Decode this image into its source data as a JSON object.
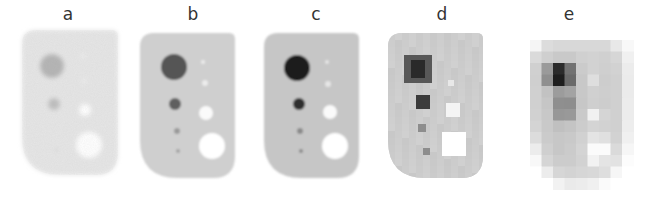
{
  "figure": {
    "width": 647,
    "height": 198,
    "background": "#ffffff",
    "panels": [
      {
        "label": "a",
        "label_x": 68,
        "style": "noisy",
        "body": {
          "x": 22,
          "y": 30,
          "w": 96,
          "h": 145,
          "fill": "#e6e6e6",
          "blur": 2.2
        },
        "hot": [
          {
            "cx": 52,
            "cy": 66,
            "r": 12,
            "fill": "#b3b3b3"
          },
          {
            "cx": 54,
            "cy": 104,
            "r": 6,
            "fill": "#bdbdbd"
          },
          {
            "cx": 56,
            "cy": 150,
            "r": 2,
            "fill": "#d8d8d8"
          }
        ],
        "cold": [
          {
            "cx": 83,
            "cy": 56,
            "r": 2,
            "fill": "#f3f3f3"
          },
          {
            "cx": 84,
            "cy": 81,
            "r": 2,
            "fill": "#f3f3f3"
          },
          {
            "cx": 85,
            "cy": 110,
            "r": 6,
            "fill": "#ffffff"
          },
          {
            "cx": 89,
            "cy": 145,
            "r": 13,
            "fill": "#ffffff"
          }
        ]
      },
      {
        "label": "b",
        "label_x": 193,
        "style": "smooth",
        "body": {
          "x": 140,
          "y": 33,
          "w": 95,
          "h": 145,
          "fill": "#cfcfcf",
          "blur": 1.2
        },
        "hot": [
          {
            "cx": 174,
            "cy": 67,
            "r": 13,
            "fill": "#555555"
          },
          {
            "cx": 175,
            "cy": 104,
            "r": 6,
            "fill": "#5e5e5e"
          },
          {
            "cx": 177,
            "cy": 131,
            "r": 3,
            "fill": "#9a9a9a"
          },
          {
            "cx": 178,
            "cy": 151,
            "r": 2,
            "fill": "#a2a2a2"
          }
        ],
        "cold": [
          {
            "cx": 203,
            "cy": 62,
            "r": 2,
            "fill": "#ececec"
          },
          {
            "cx": 205,
            "cy": 83,
            "r": 3,
            "fill": "#ececec"
          },
          {
            "cx": 206,
            "cy": 113,
            "r": 7,
            "fill": "#fafafa"
          },
          {
            "cx": 212,
            "cy": 146,
            "r": 13,
            "fill": "#ffffff"
          }
        ]
      },
      {
        "label": "c",
        "label_x": 316,
        "style": "smooth",
        "body": {
          "x": 264,
          "y": 33,
          "w": 95,
          "h": 145,
          "fill": "#c6c6c6",
          "blur": 1.3
        },
        "hot": [
          {
            "cx": 297,
            "cy": 68,
            "r": 13,
            "fill": "#1f1f1f"
          },
          {
            "cx": 299,
            "cy": 104,
            "r": 6,
            "fill": "#2e2e2e"
          },
          {
            "cx": 300,
            "cy": 131,
            "r": 3,
            "fill": "#8a8a8a"
          },
          {
            "cx": 301,
            "cy": 151,
            "r": 2,
            "fill": "#8a8a8a"
          }
        ],
        "cold": [
          {
            "cx": 327,
            "cy": 62,
            "r": 2,
            "fill": "#e6e6e6"
          },
          {
            "cx": 328,
            "cy": 84,
            "r": 3,
            "fill": "#e6e6e6"
          },
          {
            "cx": 330,
            "cy": 112,
            "r": 7,
            "fill": "#fafafa"
          },
          {
            "cx": 335,
            "cy": 146,
            "r": 13,
            "fill": "#ffffff"
          }
        ]
      },
      {
        "label": "d",
        "label_x": 442,
        "style": "pixelated",
        "body": {
          "x": 388,
          "y": 33,
          "w": 95,
          "h": 145,
          "fill": "#cdcdcd",
          "blur": 0
        },
        "block": 7,
        "hot": [
          {
            "x": 404,
            "y": 55,
            "w": 28,
            "h": 28,
            "fill": "#585858"
          },
          {
            "x": 411,
            "y": 60,
            "w": 14,
            "h": 18,
            "fill": "#2a2a2a"
          },
          {
            "x": 416,
            "y": 95,
            "w": 14,
            "h": 14,
            "fill": "#3c3c3c"
          },
          {
            "x": 418,
            "y": 124,
            "w": 8,
            "h": 8,
            "fill": "#8d8d8d"
          },
          {
            "x": 423,
            "y": 148,
            "w": 7,
            "h": 7,
            "fill": "#8d8d8d"
          }
        ],
        "cold": [
          {
            "x": 448,
            "y": 80,
            "w": 6,
            "h": 6,
            "fill": "#e8e8e8"
          },
          {
            "x": 446,
            "y": 103,
            "w": 14,
            "h": 14,
            "fill": "#f4f4f4"
          },
          {
            "x": 442,
            "y": 132,
            "w": 24,
            "h": 24,
            "fill": "#ffffff"
          }
        ]
      },
      {
        "label": "e",
        "label_x": 569,
        "style": "coarse",
        "body": {
          "x": 530,
          "y": 40,
          "w": 104,
          "h": 148,
          "fill": "#d3d3d3",
          "blur": 0
        },
        "block": 11.5,
        "grid": [
          [
            "#f5f5f5",
            "#dcdcdc",
            "#d8d8d8",
            "#d8d8d8",
            "#d8d8d8",
            "#d8d8d8",
            "#d8d8d8",
            "#e8e8e8",
            "#f8f8f8"
          ],
          [
            "#dadada",
            "#cfcfcf",
            "#c9c9c9",
            "#c9c9c9",
            "#d0d0d0",
            "#d2d2d2",
            "#d0d0d0",
            "#d6d6d6",
            "#f0f0f0"
          ],
          [
            "#d0d0d0",
            "#9a9a9a",
            "#2b2b2b",
            "#727272",
            "#cbcbcb",
            "#d2d2d2",
            "#cfcfcf",
            "#d2d2d2",
            "#ececec"
          ],
          [
            "#cfcfcf",
            "#8f8f8f",
            "#1e1e1e",
            "#6a6a6a",
            "#c8c8c8",
            "#dedede",
            "#cdcdcd",
            "#d0d0d0",
            "#ebebeb"
          ],
          [
            "#d0d0d0",
            "#c2c2c2",
            "#9c9c9c",
            "#a3a3a3",
            "#c8c8c8",
            "#d0d0d0",
            "#cecece",
            "#d0d0d0",
            "#ebebeb"
          ],
          [
            "#d0d0d0",
            "#c6c6c6",
            "#8f8f8f",
            "#8e8e8e",
            "#c7c7c7",
            "#cfcfcf",
            "#cdcdcd",
            "#d0d0d0",
            "#ececec"
          ],
          [
            "#d1d1d1",
            "#c8c8c8",
            "#979797",
            "#999999",
            "#cacaca",
            "#f1f1f1",
            "#d5d5d5",
            "#d0d0d0",
            "#ececec"
          ],
          [
            "#d4d4d4",
            "#c9c9c9",
            "#c0c0c0",
            "#c4c4c4",
            "#cccccc",
            "#d4d4d4",
            "#d2d2d2",
            "#d0d0d0",
            "#ededed"
          ],
          [
            "#dcdcdc",
            "#cbcbcb",
            "#c7c7c7",
            "#c9c9c9",
            "#d1d1d1",
            "#e4e4e4",
            "#e0e0e0",
            "#d2d2d2",
            "#f0f0f0"
          ],
          [
            "#ececec",
            "#cfcfcf",
            "#c7c7c7",
            "#cbcbcb",
            "#d4d4d4",
            "#fbfbfb",
            "#fbfbfb",
            "#dadada",
            "#f6f6f6"
          ],
          [
            "#f8f8f8",
            "#d5d5d5",
            "#cccccc",
            "#cccccc",
            "#d2d2d2",
            "#f2f2f2",
            "#e4e4e4",
            "#e2e2e2",
            "#fcfcfc"
          ],
          [
            "#ffffff",
            "#ececec",
            "#d6d6d6",
            "#d3d3d3",
            "#d6d6d6",
            "#d8d8d8",
            "#dedede",
            "#f6f6f6",
            "#ffffff"
          ],
          [
            "#ffffff",
            "#ffffff",
            "#f2f2f2",
            "#eaeaea",
            "#ececec",
            "#f0f0f0",
            "#fafafa",
            "#ffffff",
            "#ffffff"
          ]
        ]
      }
    ]
  }
}
